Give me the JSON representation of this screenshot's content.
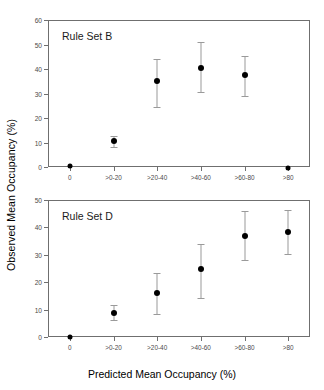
{
  "figure": {
    "ylabel": "Observed Mean Occupancy (%)",
    "xlabel": "Predicted Mean Occupancy (%)",
    "categories": [
      "0",
      ">0-20",
      ">20-40",
      ">40-60",
      ">60-80",
      ">80"
    ]
  },
  "chart_data": [
    {
      "type": "scatter",
      "title": "Rule Set B",
      "panel": "top",
      "xlabel": "Predicted Mean Occupancy (%)",
      "ylabel": "Observed Mean Occupancy (%)",
      "categories": [
        "0",
        ">0-20",
        ">20-40",
        ">40-60",
        ">60-80",
        ">80"
      ],
      "values": [
        0.3,
        10.5,
        35.0,
        40.5,
        37.5,
        -0.3
      ],
      "error_low": [
        0.3,
        8.0,
        24.5,
        30.5,
        29.0,
        -0.3
      ],
      "error_high": [
        0.3,
        12.8,
        44.0,
        51.0,
        45.5,
        -0.3
      ],
      "ylim": [
        0,
        60
      ],
      "yticks": [
        0,
        10,
        20,
        30,
        40,
        50,
        60
      ],
      "grid": false,
      "legend": "none"
    },
    {
      "type": "scatter",
      "title": "Rule Set D",
      "panel": "bottom",
      "xlabel": "Predicted Mean Occupancy (%)",
      "ylabel": "Observed Mean Occupancy (%)",
      "categories": [
        "0",
        ">0-20",
        ">20-40",
        ">40-60",
        ">60-80",
        ">80"
      ],
      "values": [
        0.0,
        8.7,
        16.0,
        25.0,
        37.0,
        38.3
      ],
      "error_low": [
        0.0,
        6.3,
        8.3,
        14.2,
        28.2,
        30.3
      ],
      "error_high": [
        0.0,
        11.5,
        23.5,
        34.0,
        46.0,
        46.4
      ],
      "ylim": [
        0,
        50
      ],
      "yticks": [
        0,
        10,
        20,
        30,
        40,
        50
      ],
      "grid": false,
      "legend": "none"
    }
  ],
  "colors": {
    "marker": "#000000",
    "error": "#9a9a9a",
    "axis": "#6f6f6f",
    "tick_text": "#4a4a4a"
  }
}
